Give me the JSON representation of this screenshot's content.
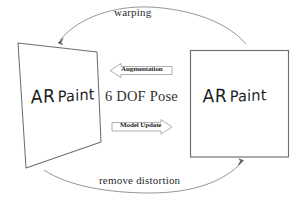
{
  "diagram": {
    "stroke_color": "#6f6f6f",
    "text_color": "#2b2b2b",
    "background": "#ffffff",
    "nodes": [
      {
        "id": "warped-view",
        "shape": "quadrilateral",
        "label_primary": "AR",
        "label_secondary": "Paint",
        "full_label": "AR Paint"
      },
      {
        "id": "rectified-view",
        "shape": "rectangle",
        "label_primary": "AR",
        "label_secondary": "Paint",
        "full_label": "AR Paint"
      }
    ],
    "center_label": "6 DOF Pose",
    "arrows": [
      {
        "id": "top-arc",
        "label": "warping",
        "direction": "right-to-left"
      },
      {
        "id": "bottom-arc",
        "label": "remove distortion",
        "direction": "left-to-right"
      },
      {
        "id": "augmentation-arrow",
        "label": "Augmentation",
        "direction": "left"
      },
      {
        "id": "model-update-arrow",
        "label": "Model Update",
        "direction": "right"
      }
    ]
  }
}
